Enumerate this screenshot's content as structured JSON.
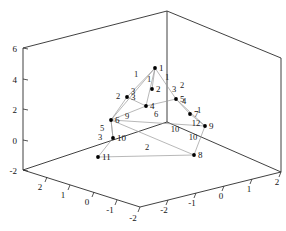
{
  "figure": {
    "title": "",
    "background": "#ffffff",
    "frame_color": "#2b2b2b",
    "edge_color": "#9a9a9a",
    "node_color": "#000000"
  },
  "chart_data": {
    "type": "scatter",
    "title": "",
    "xlabel": "",
    "ylabel": "",
    "zlabel": "",
    "projection": "3d",
    "grid": false,
    "legend": false,
    "axes": {
      "x": {
        "ticks": [
          2,
          1,
          0,
          -1,
          -2
        ],
        "tick_labels": [
          "2",
          "1",
          "0",
          "-1",
          "-2"
        ],
        "lim": [
          2,
          -2
        ]
      },
      "y": {
        "ticks": [
          -2,
          -1,
          0,
          1,
          2
        ],
        "tick_labels": [
          "-2",
          "-1",
          "0",
          "1",
          "2"
        ],
        "lim": [
          -2,
          2
        ]
      },
      "z": {
        "ticks": [
          -2,
          0,
          2,
          4,
          6
        ],
        "tick_labels": [
          "-2",
          "0",
          "2",
          "4",
          "6"
        ],
        "lim": [
          -2,
          6
        ]
      }
    },
    "nodes": [
      {
        "id": 1,
        "label": "1",
        "px": 155,
        "py": 68
      },
      {
        "id": 2,
        "label": "2",
        "px": 152,
        "py": 89
      },
      {
        "id": 3,
        "label": "3",
        "px": 127,
        "py": 97
      },
      {
        "id": 4,
        "label": "4",
        "px": 146,
        "py": 106
      },
      {
        "id": 5,
        "label": "5",
        "px": 176,
        "py": 99
      },
      {
        "id": 6,
        "label": "6",
        "px": 111,
        "py": 120
      },
      {
        "id": 7,
        "label": "7",
        "px": 190,
        "py": 114
      },
      {
        "id": 8,
        "label": "8",
        "px": 194,
        "py": 155
      },
      {
        "id": 9,
        "label": "9",
        "px": 205,
        "py": 126
      },
      {
        "id": 10,
        "label": "10",
        "px": 113,
        "py": 138
      },
      {
        "id": 11,
        "label": "11",
        "px": 98,
        "py": 157
      }
    ],
    "edges": [
      {
        "from": 1,
        "to": 2,
        "weight": "1"
      },
      {
        "from": 1,
        "to": 3,
        "weight": "1"
      },
      {
        "from": 1,
        "to": 5,
        "weight": "1"
      },
      {
        "from": 1,
        "to": 4,
        "weight": ""
      },
      {
        "from": 1,
        "to": 6,
        "weight": ""
      },
      {
        "from": 3,
        "to": 6,
        "weight": "2"
      },
      {
        "from": 3,
        "to": 4,
        "weight": ""
      },
      {
        "from": 5,
        "to": 7,
        "weight": "2"
      },
      {
        "from": 5,
        "to": 4,
        "weight": "4"
      },
      {
        "from": 7,
        "to": 9,
        "weight": "1"
      },
      {
        "from": 6,
        "to": 10,
        "weight": "9"
      },
      {
        "from": 6,
        "to": 4,
        "weight": "6"
      },
      {
        "from": 6,
        "to": 8,
        "weight": "10"
      },
      {
        "from": 6,
        "to": 9,
        "weight": ""
      },
      {
        "from": 10,
        "to": 11,
        "weight": "5"
      },
      {
        "from": 10,
        "to": 6,
        "weight": "3"
      },
      {
        "from": 11,
        "to": 8,
        "weight": "2"
      },
      {
        "from": 9,
        "to": 8,
        "weight": "10"
      },
      {
        "from": 9,
        "to": 5,
        "weight": "12"
      }
    ],
    "edge_labels": [
      {
        "text": "1",
        "px": 136,
        "py": 77
      },
      {
        "text": "1",
        "px": 149,
        "py": 82
      },
      {
        "text": "1",
        "px": 167,
        "py": 80
      },
      {
        "text": "2",
        "px": 118,
        "py": 99
      },
      {
        "text": "3",
        "px": 133,
        "py": 94
      },
      {
        "text": "3",
        "px": 174,
        "py": 92
      },
      {
        "text": "4",
        "px": 184,
        "py": 104
      },
      {
        "text": "2",
        "px": 182,
        "py": 88
      },
      {
        "text": "1",
        "px": 199,
        "py": 113
      },
      {
        "text": "5",
        "px": 102,
        "py": 131
      },
      {
        "text": "3",
        "px": 100,
        "py": 140
      },
      {
        "text": "9",
        "px": 127,
        "py": 119
      },
      {
        "text": "6",
        "px": 156,
        "py": 117
      },
      {
        "text": "10",
        "px": 175,
        "py": 132
      },
      {
        "text": "12",
        "px": 196,
        "py": 126
      },
      {
        "text": "10",
        "px": 193,
        "py": 140
      },
      {
        "text": "2",
        "px": 147,
        "py": 150
      }
    ]
  }
}
